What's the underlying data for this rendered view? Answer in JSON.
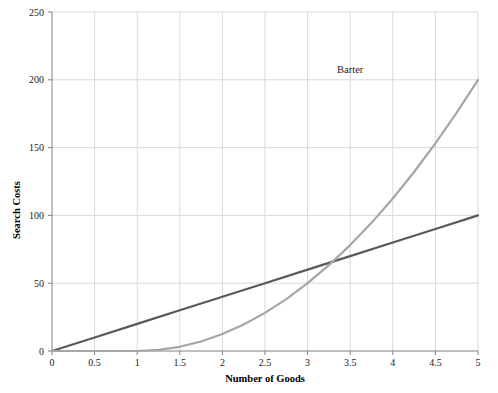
{
  "chart_data": {
    "type": "line",
    "title": "",
    "subtitle": "",
    "xlabel": "Number of Goods",
    "ylabel": "Search Costs",
    "xlim": [
      0,
      5
    ],
    "ylim": [
      0,
      250
    ],
    "xticks": [
      "0",
      "0.5",
      "1",
      "1.5",
      "2",
      "2.5",
      "3",
      "3.5",
      "4",
      "4.5",
      "5"
    ],
    "xtick_values": [
      0,
      0.5,
      1,
      1.5,
      2,
      2.5,
      3,
      3.5,
      4,
      4.5,
      5
    ],
    "yticks": [
      "0",
      "50",
      "100",
      "150",
      "200",
      "250"
    ],
    "ytick_values": [
      0,
      50,
      100,
      150,
      200,
      250
    ],
    "grid": true,
    "grid_color": "#d9d9d9",
    "axis_color": "#808080",
    "plot_background": "#ffffff",
    "legend_position": "inline-annotation",
    "annotations": [
      {
        "text": "Barter",
        "x": 3.5,
        "y": 205,
        "series": "Barter"
      }
    ],
    "series": [
      {
        "name": "Money",
        "color": "#595959",
        "line_width": 2.2,
        "annotation_label": "",
        "x": [
          0,
          0.5,
          1,
          1.5,
          2,
          2.5,
          3,
          3.5,
          4,
          4.5,
          5
        ],
        "values": [
          0,
          10,
          20,
          30,
          40,
          50,
          60,
          70,
          80,
          90,
          100
        ]
      },
      {
        "name": "Barter",
        "color": "#a6a6a6",
        "line_width": 2.2,
        "annotation_label": "Barter",
        "x": [
          0,
          0.25,
          0.5,
          0.75,
          1,
          1.25,
          1.5,
          1.75,
          2,
          2.25,
          2.5,
          2.75,
          3,
          3.25,
          3.5,
          3.75,
          4,
          4.25,
          4.5,
          4.75,
          5
        ],
        "values": [
          0,
          0,
          0,
          0,
          0,
          0.8,
          3.1,
          7.0,
          12.5,
          19.5,
          28.1,
          38.3,
          50.0,
          63.3,
          78.1,
          94.5,
          112.5,
          132.0,
          153.1,
          175.8,
          200.0
        ]
      }
    ]
  }
}
